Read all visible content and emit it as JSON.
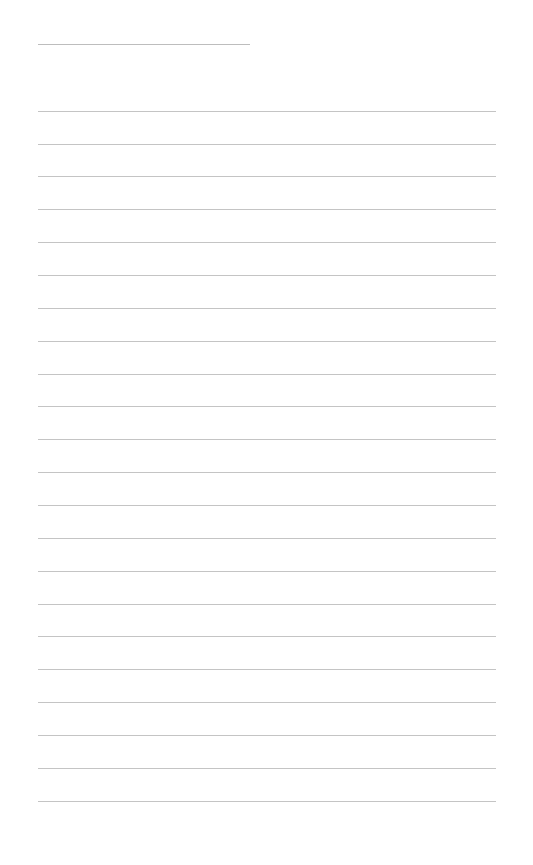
{
  "page": {
    "type": "lined-notepad-page",
    "background_color": "#ffffff",
    "line_color": "#c4c4c4"
  },
  "header_line": {
    "x_start": 38,
    "x_end": 250,
    "y": 44,
    "color": "#bdbdbd"
  },
  "ruled_lines": {
    "count": 22,
    "x_start": 38,
    "x_end": 496,
    "first_y": 110.7,
    "spacing": 32.86
  }
}
